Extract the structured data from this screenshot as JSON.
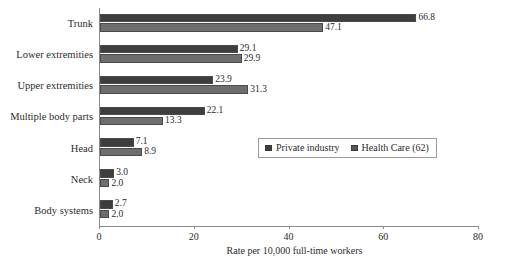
{
  "chart_data": {
    "type": "bar",
    "orientation": "horizontal",
    "title": "",
    "xlabel": "Rate per 10,000 full-time workers",
    "ylabel": "",
    "xlim": [
      0,
      80
    ],
    "xticks": [
      0,
      20,
      40,
      60,
      80
    ],
    "xtick_labels": [
      "0",
      "20",
      "40",
      "60",
      "80"
    ],
    "grid": false,
    "legend_position": "middle-right",
    "categories": [
      "Trunk",
      "Lower extremities",
      "Upper extremities",
      "Multiple body parts",
      "Head",
      "Neck",
      "Body systems"
    ],
    "series": [
      {
        "name": "Private industry",
        "color": "#3e3e3e",
        "values": [
          66.8,
          29.1,
          23.9,
          22.1,
          7.1,
          3.0,
          2.7
        ],
        "value_labels": [
          "66.8",
          "29.1",
          "23.9",
          "22.1",
          "7.1",
          "3.0",
          "2.7"
        ]
      },
      {
        "name": "Health Care (62)",
        "color": "#6e6e6e",
        "values": [
          47.1,
          29.9,
          31.3,
          13.3,
          8.9,
          2.0,
          2.0
        ],
        "value_labels": [
          "47.1",
          "29.9",
          "31.3",
          "13.3",
          "8.9",
          "2.0",
          "2.0"
        ]
      }
    ]
  },
  "legend": {
    "items": [
      {
        "label": "Private industry"
      },
      {
        "label": "Health Care (62)"
      }
    ]
  }
}
